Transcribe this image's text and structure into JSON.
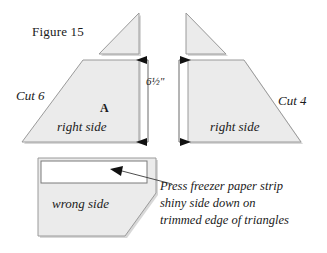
{
  "figure": {
    "caption_label": "Figure 15",
    "left_cut_label": "Cut 6",
    "right_cut_label": "Cut 4",
    "piece_letter": "A",
    "left_side_label": "right side",
    "right_side_label": "right side",
    "dimension_label": "6½\"",
    "bottom_side_label": "wrong side",
    "instruction_line1": "Press freezer paper strip",
    "instruction_line2": "shiny side down on",
    "instruction_line3": "trimmed edge of triangles"
  },
  "colors": {
    "fabric_fill": "#ebebeb",
    "fabric_stroke": "#8c8c8c",
    "strip_fill": "#ffffff",
    "shadow": "#d6d6d6",
    "ink": "#1a1a1a",
    "leader": "#3a3a3a",
    "background": "#ffffff"
  }
}
